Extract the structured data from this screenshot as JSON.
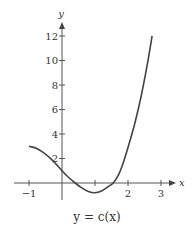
{
  "chart_data": {
    "type": "line",
    "title": "",
    "caption": "y = c(x)",
    "xlabel": "x",
    "ylabel": "y",
    "xlim": [
      -1,
      3
    ],
    "ylim": [
      -1,
      12.5
    ],
    "grid": false,
    "x_ticks": [
      -1,
      1,
      2,
      3
    ],
    "x_tick_labels": [
      "−1",
      "",
      "2",
      "3"
    ],
    "y_ticks": [
      2,
      4,
      6,
      8,
      10,
      12
    ],
    "y_tick_labels": [
      "2",
      "4",
      "6",
      "8",
      "10",
      "12"
    ],
    "series": [
      {
        "name": "c(x)",
        "x": [
          -1,
          -0.75,
          -0.5,
          -0.25,
          0,
          0.2,
          0.4,
          0.6,
          0.8,
          1.0,
          1.2,
          1.4,
          1.55,
          1.7,
          1.85,
          2.0,
          2.2,
          2.4,
          2.6,
          2.73
        ],
        "y": [
          3,
          2.8,
          2.35,
          1.75,
          1.0,
          0.45,
          0.0,
          -0.4,
          -0.7,
          -0.8,
          -0.65,
          -0.3,
          0.0,
          0.6,
          1.6,
          2.9,
          4.8,
          7.1,
          9.9,
          12.0
        ]
      }
    ]
  }
}
